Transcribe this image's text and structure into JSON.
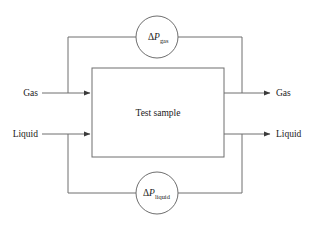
{
  "diagram": {
    "background_color": "#ffffff",
    "line_color": "#6e6e6e",
    "text_color": "#1a1a1a",
    "center_box": {
      "label": "Test sample"
    },
    "inlets": [
      {
        "id": "gas-inlet",
        "label": "Gas"
      },
      {
        "id": "liquid-inlet",
        "label": "Liquid"
      }
    ],
    "outlets": [
      {
        "id": "gas-outlet",
        "label": "Gas"
      },
      {
        "id": "liquid-outlet",
        "label": "Liquid"
      }
    ],
    "gauges": [
      {
        "id": "gauge-gas",
        "position": "top",
        "delta": "Δ",
        "variable": "P",
        "subscript": "gas"
      },
      {
        "id": "gauge-liquid",
        "position": "bottom",
        "delta": "Δ",
        "variable": "P",
        "subscript": "liquid"
      }
    ]
  }
}
